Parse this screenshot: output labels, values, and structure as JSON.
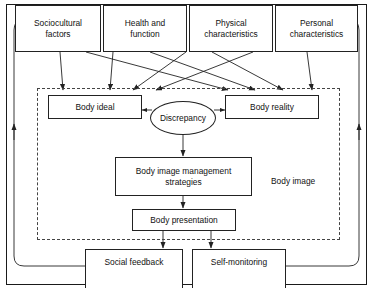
{
  "diagram": {
    "colors": {
      "stroke": "#222222",
      "dashed": "#444444",
      "background": "#ffffff",
      "text": "#111111"
    },
    "outer_frame": {
      "name": "outer-frame"
    },
    "region": {
      "label": "Body image",
      "style": "dashed"
    },
    "inputs": [
      {
        "id": "sociocultural",
        "label": "Sociocultural\nfactors"
      },
      {
        "id": "health",
        "label": "Health and\nfunction"
      },
      {
        "id": "physical",
        "label": "Physical\ncharacteristics"
      },
      {
        "id": "personal",
        "label": "Personal\ncharacteristics"
      }
    ],
    "core": [
      {
        "id": "body-ideal",
        "label": "Body ideal"
      },
      {
        "id": "discrepancy",
        "label": "Discrepancy",
        "shape": "ellipse"
      },
      {
        "id": "body-reality",
        "label": "Body reality"
      },
      {
        "id": "strategies",
        "label": "Body image management\nstrategies"
      },
      {
        "id": "presentation",
        "label": "Body presentation"
      }
    ],
    "outputs": [
      {
        "id": "social-feedback",
        "label": "Social feedback"
      },
      {
        "id": "self-monitoring",
        "label": "Self-monitoring"
      }
    ],
    "connections": [
      {
        "from": "sociocultural",
        "to": "body-ideal"
      },
      {
        "from": "sociocultural",
        "to": "body-reality"
      },
      {
        "from": "health",
        "to": "body-ideal"
      },
      {
        "from": "health",
        "to": "body-reality"
      },
      {
        "from": "physical",
        "to": "body-ideal"
      },
      {
        "from": "physical",
        "to": "body-reality"
      },
      {
        "from": "personal",
        "to": "body-ideal"
      },
      {
        "from": "personal",
        "to": "body-reality"
      },
      {
        "from": "body-ideal",
        "to": "discrepancy",
        "bidirectional": true
      },
      {
        "from": "body-reality",
        "to": "discrepancy",
        "bidirectional": true
      },
      {
        "from": "discrepancy",
        "to": "strategies"
      },
      {
        "from": "strategies",
        "to": "presentation"
      },
      {
        "from": "presentation",
        "to": "social-feedback"
      },
      {
        "from": "presentation",
        "to": "self-monitoring"
      },
      {
        "from": "social-feedback",
        "to": "feedback-loop-left"
      },
      {
        "from": "self-monitoring",
        "to": "feedback-loop-right"
      }
    ]
  }
}
